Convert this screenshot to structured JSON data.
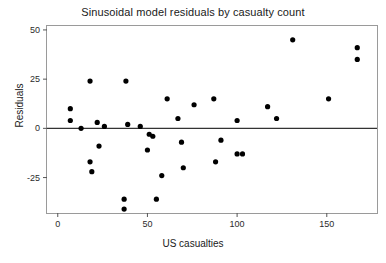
{
  "chart_data": {
    "type": "scatter",
    "title": "Sinusoidal model residuals by casualty count",
    "xlabel": "US casualties",
    "ylabel": "Residuals",
    "xlim": [
      -6,
      178
    ],
    "ylim": [
      -43,
      52
    ],
    "xticks": [
      0,
      50,
      100,
      150
    ],
    "xtick_labels": [
      "0",
      "50",
      "100",
      "150"
    ],
    "yticks": [
      -25,
      0,
      25,
      50
    ],
    "ytick_labels": [
      "-25",
      "0",
      "25",
      "50"
    ],
    "grid": false,
    "legend": null,
    "reference_line": {
      "y": 0,
      "color": "#333333"
    },
    "marker": {
      "shape": "circle",
      "color": "#000000",
      "size": 3
    },
    "points": [
      {
        "x": 7,
        "y": 10
      },
      {
        "x": 7,
        "y": 4
      },
      {
        "x": 13,
        "y": 0
      },
      {
        "x": 18,
        "y": 24
      },
      {
        "x": 18,
        "y": -17
      },
      {
        "x": 19,
        "y": -22
      },
      {
        "x": 22,
        "y": 3
      },
      {
        "x": 23,
        "y": -9
      },
      {
        "x": 26,
        "y": 1
      },
      {
        "x": 37,
        "y": -36
      },
      {
        "x": 37,
        "y": -41
      },
      {
        "x": 38,
        "y": 24
      },
      {
        "x": 39,
        "y": 2
      },
      {
        "x": 46,
        "y": 1
      },
      {
        "x": 50,
        "y": -11
      },
      {
        "x": 51,
        "y": -3
      },
      {
        "x": 53,
        "y": -4
      },
      {
        "x": 55,
        "y": -36
      },
      {
        "x": 58,
        "y": -24
      },
      {
        "x": 61,
        "y": 15
      },
      {
        "x": 67,
        "y": 5
      },
      {
        "x": 69,
        "y": -7
      },
      {
        "x": 70,
        "y": -20
      },
      {
        "x": 76,
        "y": 12
      },
      {
        "x": 87,
        "y": 15
      },
      {
        "x": 88,
        "y": -17
      },
      {
        "x": 91,
        "y": -6
      },
      {
        "x": 100,
        "y": 4
      },
      {
        "x": 100,
        "y": -13
      },
      {
        "x": 103,
        "y": -13
      },
      {
        "x": 117,
        "y": 11
      },
      {
        "x": 122,
        "y": 5
      },
      {
        "x": 131,
        "y": 45
      },
      {
        "x": 151,
        "y": 15
      },
      {
        "x": 167,
        "y": 41
      },
      {
        "x": 167,
        "y": 35
      }
    ]
  }
}
